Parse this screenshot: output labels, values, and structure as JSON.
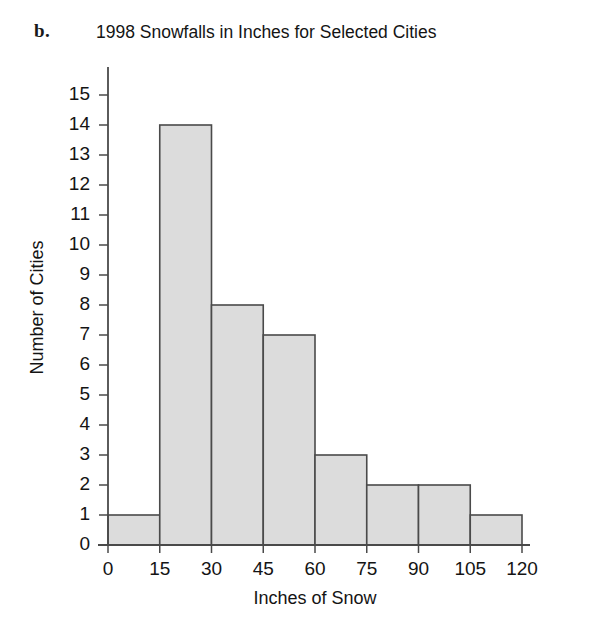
{
  "panel": {
    "label": "b."
  },
  "chart_data": {
    "type": "bar",
    "title": "1998 Snowfalls in Inches for Selected Cities",
    "xlabel": "Inches of Snow",
    "ylabel": "Number of Cities",
    "bin_width": 15,
    "categories": [
      "0-15",
      "15-30",
      "30-45",
      "45-60",
      "60-75",
      "75-90",
      "90-105",
      "105-120"
    ],
    "bin_edges": [
      0,
      15,
      30,
      45,
      60,
      75,
      90,
      105,
      120
    ],
    "values": [
      1,
      14,
      8,
      7,
      3,
      2,
      2,
      1
    ],
    "xlim": [
      0,
      120
    ],
    "ylim": [
      0,
      15
    ],
    "xticks": [
      "0",
      "15",
      "30",
      "45",
      "60",
      "75",
      "90",
      "105",
      "120"
    ],
    "yticks": [
      "0",
      "1",
      "2",
      "3",
      "4",
      "5",
      "6",
      "7",
      "8",
      "9",
      "10",
      "11",
      "12",
      "13",
      "14",
      "15"
    ],
    "grid": false,
    "legend": false,
    "bar_fill_color": "#dcdcdc",
    "bar_edge_color": "#4a4a4a",
    "axis_color": "#4a4a4a"
  }
}
